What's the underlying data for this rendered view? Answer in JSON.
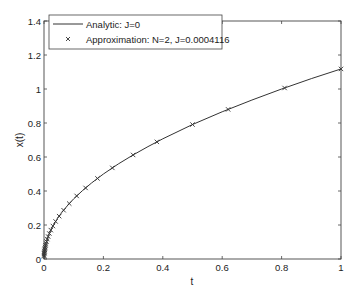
{
  "chart_data": {
    "type": "line",
    "title": "",
    "xlabel": "t",
    "ylabel": "x(t)",
    "xlim": [
      0,
      1
    ],
    "ylim": [
      0,
      1.4
    ],
    "grid": false,
    "legend_position": "upper-left",
    "xticks": [
      "0",
      "0.2",
      "0.4",
      "0.6",
      "0.8",
      "1"
    ],
    "xtick_values": [
      0,
      0.2,
      0.4,
      0.6,
      0.8,
      1
    ],
    "yticks": [
      "0",
      "0.2",
      "0.4",
      "0.6",
      "0.8",
      "1",
      "1.2",
      "1.4"
    ],
    "ytick_values": [
      0,
      0.2,
      0.4,
      0.6,
      0.8,
      1,
      1.2,
      1.4
    ],
    "series": [
      {
        "name": "Analytic: J=0",
        "style": "solid-line",
        "x": [
          0,
          0.0005,
          0.001,
          0.002,
          0.004,
          0.007,
          0.01,
          0.015,
          0.02,
          0.03,
          0.045,
          0.06,
          0.08,
          0.1,
          0.13,
          0.16,
          0.2,
          0.25,
          0.3,
          0.35,
          0.4,
          0.5,
          0.6,
          0.7,
          0.8,
          0.9,
          1.0
        ],
        "values": [
          0,
          0.025,
          0.035,
          0.05,
          0.071,
          0.094,
          0.112,
          0.137,
          0.158,
          0.194,
          0.237,
          0.274,
          0.316,
          0.354,
          0.403,
          0.447,
          0.5,
          0.559,
          0.612,
          0.661,
          0.707,
          0.791,
          0.866,
          0.935,
          1.0,
          1.061,
          1.118
        ]
      },
      {
        "name": "Approximation: N=2, J=0.0004116",
        "style": "x-markers",
        "x": [
          1.0,
          0.81,
          0.62,
          0.5,
          0.38,
          0.3,
          0.23,
          0.18,
          0.14,
          0.11,
          0.085,
          0.066,
          0.051,
          0.039,
          0.03,
          0.023,
          0.018,
          0.014,
          0.011,
          0.0085,
          0.0066,
          0.0051,
          0.0039,
          0.003,
          0.0023,
          0.0018,
          0.0014,
          0.001,
          0.0007,
          0.0004,
          0.0002
        ],
        "values": [
          1.118,
          1.006,
          0.88,
          0.791,
          0.689,
          0.612,
          0.536,
          0.474,
          0.418,
          0.371,
          0.326,
          0.287,
          0.252,
          0.221,
          0.194,
          0.17,
          0.15,
          0.132,
          0.117,
          0.103,
          0.091,
          0.08,
          0.07,
          0.061,
          0.054,
          0.047,
          0.042,
          0.035,
          0.03,
          0.022,
          0.016
        ]
      }
    ]
  },
  "legend": {
    "items": [
      {
        "label": "Analytic: J=0",
        "symbol": "line"
      },
      {
        "label": "Approximation: N=2, J=0.0004116",
        "symbol": "x-marker"
      }
    ]
  },
  "colors": {
    "line": "#333333",
    "axis": "#444444",
    "background": "#ffffff"
  }
}
